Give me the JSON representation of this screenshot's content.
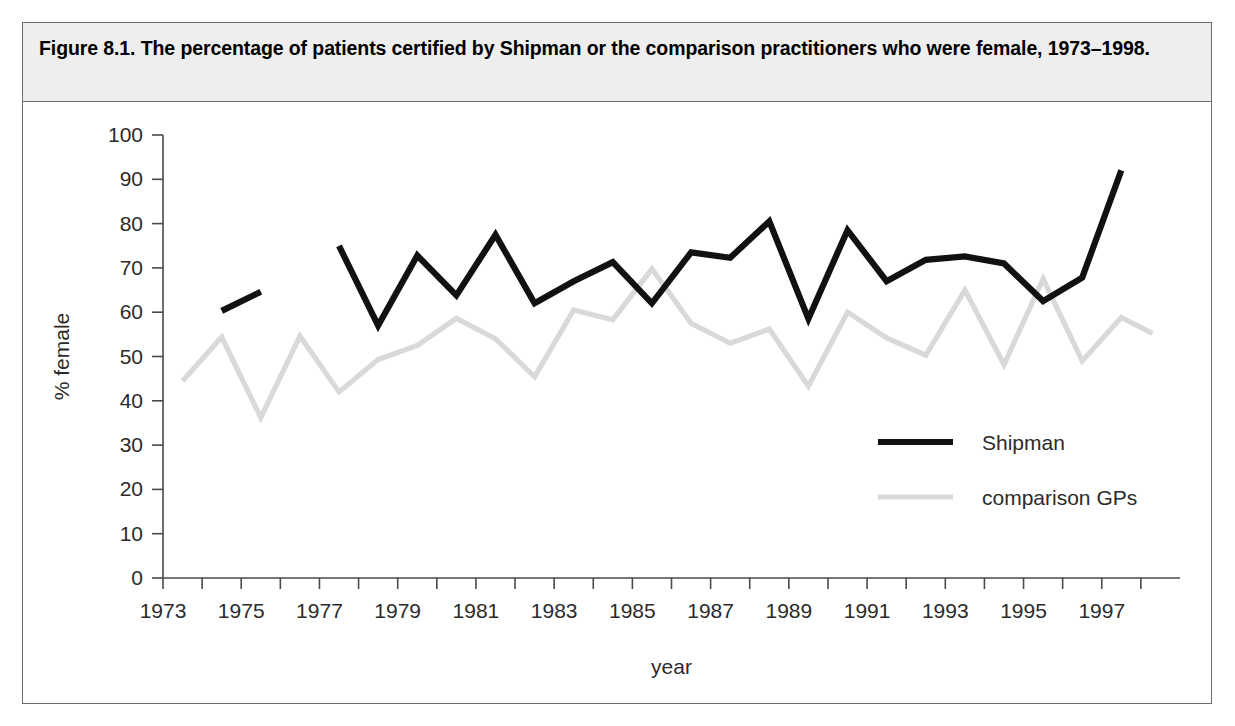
{
  "figure": {
    "caption": "Figure 8.1. The percentage of patients certified by Shipman or the comparison practitioners who were female, 1973–1998."
  },
  "colors": {
    "shipman_line": "#111111",
    "gp_line": "#d9d9d9",
    "axis": "#4a4a4a",
    "caption_band": "#eeeeee",
    "frame": "#6d6d6d",
    "text": "#2b2b2b"
  },
  "chart_data": {
    "type": "line",
    "title": "Figure 8.1. The percentage of patients certified by Shipman or the comparison practitioners who were female, 1973–1998.",
    "xlabel": "year",
    "ylabel": "% female",
    "xlim": [
      1973,
      1998
    ],
    "ylim": [
      0,
      100
    ],
    "yticks": [
      0,
      10,
      20,
      30,
      40,
      50,
      60,
      70,
      80,
      90,
      100
    ],
    "ytick_labels": [
      "0",
      "10",
      "20",
      "30",
      "40",
      "50",
      "60",
      "70",
      "80",
      "90",
      "100"
    ],
    "xticks": [
      1973,
      1974,
      1975,
      1976,
      1977,
      1978,
      1979,
      1980,
      1981,
      1982,
      1983,
      1984,
      1985,
      1986,
      1987,
      1988,
      1989,
      1990,
      1991,
      1992,
      1993,
      1994,
      1995,
      1996,
      1997,
      1998
    ],
    "xtick_labels": [
      "1973",
      "",
      "1975",
      "",
      "1977",
      "",
      "1979",
      "",
      "1981",
      "",
      "1983",
      "",
      "1985",
      "",
      "1987",
      "",
      "1989",
      "",
      "1991",
      "",
      "1993",
      "",
      "1995",
      "",
      "1997",
      ""
    ],
    "grid": false,
    "legend_position": "inside-right",
    "series": [
      {
        "name": "Shipman",
        "color": "#111111",
        "x": [
          1974.5,
          1975.5,
          1977.5,
          1978.5,
          1979.5,
          1980.5,
          1981.5,
          1982.5,
          1983.5,
          1984.5,
          1985.5,
          1986.5,
          1987.5,
          1988.5,
          1989.5,
          1990.5,
          1991.5,
          1992.5,
          1993.5,
          1994.5,
          1995.5,
          1996.5,
          1997.5
        ],
        "values": [
          60.3,
          64.6,
          75.0,
          57.0,
          72.8,
          63.8,
          77.5,
          62.0,
          67.0,
          71.3,
          62.0,
          73.5,
          72.3,
          80.5,
          58.5,
          78.5,
          67.0,
          71.8,
          72.6,
          71.0,
          62.5,
          67.8,
          92.0
        ]
      },
      {
        "name": "comparison GPs",
        "color": "#d9d9d9",
        "x": [
          1973.5,
          1974.5,
          1975.5,
          1976.5,
          1977.5,
          1978.5,
          1979.5,
          1980.5,
          1981.5,
          1982.5,
          1983.5,
          1984.5,
          1985.5,
          1986.5,
          1987.5,
          1988.5,
          1989.5,
          1990.5,
          1991.5,
          1992.5,
          1993.5,
          1994.5,
          1995.5,
          1996.5,
          1997.5
        ],
        "values": [
          44.5,
          54.4,
          36.2,
          54.6,
          42.0,
          49.3,
          52.5,
          58.6,
          54.0,
          45.4,
          60.5,
          58.3,
          69.8,
          57.5,
          53.0,
          56.2,
          43.3,
          60.0,
          54.2,
          50.3,
          65.0,
          48.2,
          67.5,
          49.0,
          58.8
        ]
      }
    ],
    "series_extra_points": {
      "comparison GPs_last": {
        "x": 1998.3,
        "value": 55.2
      }
    }
  },
  "legend": {
    "items": [
      {
        "label": "Shipman",
        "swatch": "solid-thick-black"
      },
      {
        "label": "comparison GPs",
        "swatch": "solid-light-grey"
      }
    ]
  },
  "axes": {
    "x_axis_title": "year",
    "y_axis_title": "% female"
  }
}
